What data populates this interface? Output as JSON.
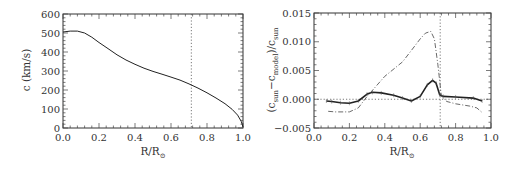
{
  "chart_data": [
    {
      "type": "line",
      "panel": "left",
      "title": "",
      "xlabel": "R/R_sun",
      "ylabel": "c (km/s)",
      "xlim": [
        0.0,
        1.0
      ],
      "ylim": [
        0,
        600
      ],
      "xticks": [
        "0.0",
        "0.2",
        "0.4",
        "0.6",
        "0.8",
        "1.0"
      ],
      "yticks": [
        "0",
        "100",
        "200",
        "300",
        "400",
        "500",
        "600"
      ],
      "vline": 0.713,
      "grid": false,
      "series": [
        {
          "name": "sound speed",
          "style": "solid",
          "x": [
            0.0,
            0.04,
            0.08,
            0.12,
            0.16,
            0.2,
            0.25,
            0.3,
            0.35,
            0.4,
            0.45,
            0.5,
            0.55,
            0.6,
            0.65,
            0.7,
            0.75,
            0.8,
            0.85,
            0.9,
            0.94,
            0.97,
            0.99,
            1.0
          ],
          "y": [
            505,
            510,
            510,
            500,
            478,
            450,
            418,
            385,
            358,
            335,
            315,
            298,
            283,
            268,
            252,
            232,
            210,
            185,
            158,
            128,
            98,
            68,
            35,
            5
          ]
        }
      ]
    },
    {
      "type": "line",
      "panel": "right",
      "title": "",
      "xlabel": "R/R_sun",
      "ylabel": "(c_sun - c_model)/c_sun",
      "xlim": [
        0.0,
        1.0
      ],
      "ylim": [
        -0.005,
        0.015
      ],
      "xticks": [
        "0.0",
        "0.2",
        "0.4",
        "0.6",
        "0.8",
        "1.0"
      ],
      "yticks": [
        "-0.005",
        "0.000",
        "0.005",
        "0.010",
        "0.015"
      ],
      "vline": 0.713,
      "hline": 0.0,
      "grid": false,
      "series": [
        {
          "name": "model A (solid, with error bars)",
          "style": "solid",
          "x": [
            0.07,
            0.1,
            0.15,
            0.2,
            0.25,
            0.3,
            0.33,
            0.38,
            0.45,
            0.5,
            0.55,
            0.6,
            0.64,
            0.67,
            0.69,
            0.71,
            0.73,
            0.8,
            0.9,
            0.95
          ],
          "y": [
            -0.0003,
            -0.0004,
            -0.0006,
            -0.0007,
            -0.0003,
            0.0009,
            0.0012,
            0.0011,
            0.0007,
            0.0002,
            -0.0003,
            0.0005,
            0.0025,
            0.0033,
            0.0028,
            0.0008,
            0.0005,
            0.0004,
            0.0002,
            -0.0003
          ]
        },
        {
          "name": "model B (dash-dot)",
          "style": "dashdot",
          "x": [
            0.08,
            0.12,
            0.2,
            0.25,
            0.3,
            0.4,
            0.5,
            0.55,
            0.6,
            0.63,
            0.66,
            0.68,
            0.7,
            0.72,
            0.75,
            0.8,
            0.88,
            0.92,
            0.95
          ],
          "y": [
            -0.0021,
            -0.0022,
            -0.0022,
            -0.0015,
            0.0005,
            0.004,
            0.0065,
            0.0085,
            0.0105,
            0.0115,
            0.0118,
            0.0105,
            0.006,
            0.0005,
            -0.0004,
            -0.0008,
            -0.0012,
            -0.0015,
            -0.0023
          ]
        }
      ]
    }
  ],
  "labels": {
    "left_ylabel": "c (km/s)",
    "right_ylabel_open": "(c",
    "right_ylabel_sub1": "sun",
    "right_ylabel_mid": "−c",
    "right_ylabel_sub2": "model",
    "right_ylabel_close": ")/c",
    "right_ylabel_sub3": "sun",
    "xlabel_main": "R/R",
    "xlabel_sub": "⊙"
  }
}
